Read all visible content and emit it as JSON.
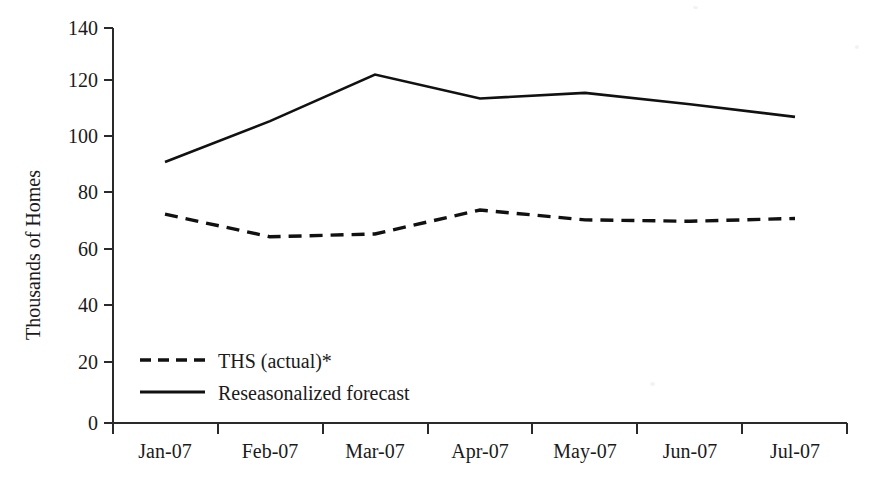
{
  "chart_data": {
    "type": "line",
    "title": "",
    "subtitle": "",
    "xlabel": "",
    "ylabel": "Thousands of Homes",
    "categories": [
      "Jan-07",
      "Feb-07",
      "Mar-07",
      "Apr-07",
      "May-07",
      "Jun-07",
      "Jul-07"
    ],
    "ylim": [
      0,
      140
    ],
    "yticks": [
      0,
      20,
      40,
      60,
      80,
      100,
      120,
      140
    ],
    "ytick_labels": [
      "0",
      "20",
      "40",
      "60",
      "80",
      "100",
      "120",
      "140"
    ],
    "grid": false,
    "legend_position": "inside-lower-left",
    "series": [
      {
        "name": "THS (actual)*",
        "style": "dashed",
        "color": "#111111",
        "values": [
          74,
          66,
          67,
          75.5,
          72,
          71.5,
          72.5
        ]
      },
      {
        "name": "Reseasonalized forecast",
        "style": "solid",
        "color": "#111111",
        "values": [
          92.5,
          107,
          123.5,
          115,
          117,
          113,
          108.5
        ]
      }
    ],
    "annotations": []
  },
  "legend": {
    "items": [
      {
        "label": "THS (actual)*",
        "style": "dashed"
      },
      {
        "label": "Reseasonalized forecast",
        "style": "solid"
      }
    ]
  },
  "colors": {
    "background": "#ffffff",
    "ink": "#111111",
    "axis": "#2a2a2a"
  }
}
